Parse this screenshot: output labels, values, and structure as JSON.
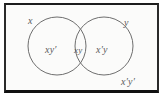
{
  "figure": {
    "type": "venn-diagram",
    "background_color": "#fbfbfa",
    "border_color": "#1d1d1d",
    "stroke_color": "#6e6e6e",
    "text_color": "#5a5a5a"
  },
  "sets": [
    {
      "name": "x",
      "label": "x",
      "cx": 57,
      "cy": 46,
      "r": 29
    },
    {
      "name": "y",
      "label": "y",
      "cx": 104,
      "cy": 46,
      "r": 29
    }
  ],
  "regions": [
    {
      "name": "x-only",
      "label": "xy′",
      "meaning": "in x, not in y"
    },
    {
      "name": "intersection",
      "label": "xy",
      "meaning": "in x and in y"
    },
    {
      "name": "y-only",
      "label": "x′y",
      "meaning": "not in x, in y"
    },
    {
      "name": "outside",
      "label": "x′y′",
      "meaning": "not in x, not in y"
    }
  ],
  "universe": {
    "x": 4,
    "y": 3,
    "width": 155,
    "height": 90
  }
}
